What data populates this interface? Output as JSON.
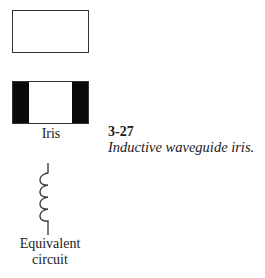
{
  "figure": {
    "number": "3-27",
    "caption": "Inductive waveguide iris."
  },
  "labels": {
    "iris": "Iris",
    "equivalent_line1": "Equivalent",
    "equivalent_line2": "circuit"
  },
  "elements": [
    {
      "name": "waveguide-cross-section",
      "shape": "rectangle",
      "fill": "#ffffff",
      "stroke": "#333333"
    },
    {
      "name": "iris-cross-section",
      "shape": "rectangle-with-side-bars",
      "bar_color": "#0a0a0a"
    },
    {
      "name": "inductor-symbol",
      "shape": "coil",
      "turns": 4
    }
  ]
}
